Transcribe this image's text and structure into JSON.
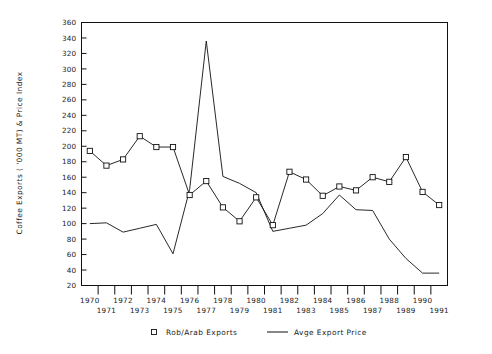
{
  "chart_data": {
    "type": "line",
    "title": "",
    "xlabel": "",
    "ylabel": "Coffee Exports ( '000 MT) & Price Index",
    "xlim": [
      1970,
      1991
    ],
    "ylim": [
      20,
      360
    ],
    "ytick_step": 20,
    "grid": false,
    "legend_position": "bottom",
    "categories": [
      1970,
      1971,
      1972,
      1973,
      1974,
      1975,
      1976,
      1977,
      1978,
      1979,
      1980,
      1981,
      1982,
      1983,
      1984,
      1985,
      1986,
      1987,
      1988,
      1989,
      1990,
      1991
    ],
    "xticklabels_top": [
      "1970",
      "1972",
      "1974",
      "1976",
      "1978",
      "1980",
      "1982",
      "1984",
      "1986",
      "1988",
      "1990"
    ],
    "xticklabels_bottom": [
      "1971",
      "1973",
      "1975",
      "1977",
      "1979",
      "1981",
      "1983",
      "1985",
      "1987",
      "1989",
      "1991"
    ],
    "yticklabels": [
      "20",
      "40",
      "60",
      "80",
      "100",
      "120",
      "140",
      "160",
      "180",
      "200",
      "220",
      "240",
      "260",
      "280",
      "300",
      "320",
      "340",
      "360"
    ],
    "series": [
      {
        "name": "Rob/Arab Exports",
        "marker": "open-square",
        "style": "line-with-markers",
        "values": [
          194,
          175,
          183,
          213,
          199,
          199,
          137,
          155,
          121,
          103,
          134,
          98,
          167,
          157,
          136,
          148,
          143,
          160,
          154,
          186,
          141,
          124
        ]
      },
      {
        "name": "Avge Export Price",
        "marker": "none",
        "style": "line",
        "values": [
          100,
          101,
          89,
          94,
          99,
          61,
          144,
          336,
          161,
          152,
          140,
          90,
          94,
          98,
          113,
          137,
          118,
          117,
          80,
          55,
          36,
          36
        ]
      }
    ]
  },
  "legend": {
    "items": [
      {
        "label": "Rob/Arab Exports",
        "swatch": "open-square-marker"
      },
      {
        "label": "Avge Export Price",
        "swatch": "solid-line"
      }
    ]
  },
  "axes": {
    "y_title": "Coffee Exports ( '000 MT) & Price Index"
  }
}
